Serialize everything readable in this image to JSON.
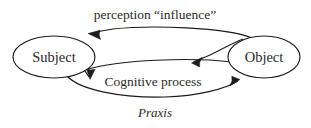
{
  "diagram": {
    "background_color": "#ffffff",
    "line_color": "#1c1c1c",
    "text_color": "#2b2b2b",
    "nodes": [
      {
        "id": "subject",
        "label": "Subject",
        "shape": "ellipse",
        "cx": 54,
        "cy": 57,
        "rx": 41,
        "ry": 21
      },
      {
        "id": "object",
        "label": "Object",
        "shape": "ellipse",
        "cx": 264,
        "cy": 57,
        "rx": 36,
        "ry": 21
      }
    ],
    "edges": [
      {
        "id": "perception-influence",
        "label": "perception “influence”",
        "from": "object",
        "to": "subject",
        "direction": "right-to-left",
        "label_position": "top",
        "style": "curved-arrow"
      },
      {
        "id": "cognitive-process-inbound",
        "label": "",
        "from": "object",
        "to": "middle",
        "direction": "right-to-left",
        "label_position": "none",
        "style": "curved-arrow"
      },
      {
        "id": "cognitive-process",
        "label": "Cognitive process",
        "from": "subject",
        "to": "middle",
        "direction": "left-to-right",
        "label_position": "middle",
        "style": "curved-arrow"
      },
      {
        "id": "praxis",
        "label": "Praxis",
        "from": "subject",
        "to": "object",
        "direction": "left-to-right",
        "label_position": "bottom",
        "style": "curved-arrow-italic-label"
      }
    ]
  }
}
